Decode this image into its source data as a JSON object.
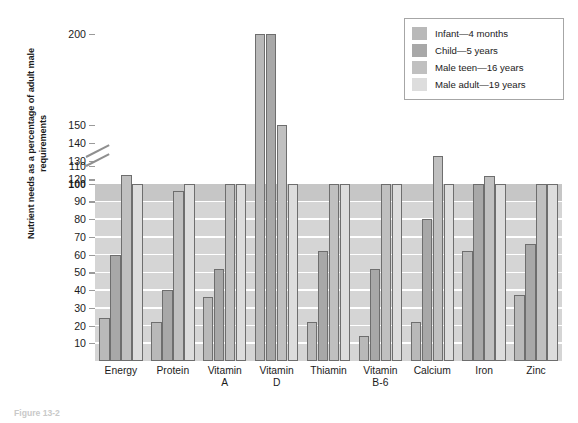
{
  "chart_data": {
    "type": "bar",
    "title": "",
    "xlabel": "",
    "ylabel": "Nutrient needs as a percentage of adult male requirements",
    "ylim": [
      0,
      210
    ],
    "grid": true,
    "legend_position": "top-right",
    "axis_break": {
      "after": 110,
      "before": 150,
      "symbol": "double-slash"
    },
    "reference_line": 100,
    "categories": [
      "Energy",
      "Protein",
      "Vitamin A",
      "Vitamin D",
      "Thiamin",
      "Vitamin B-6",
      "Calcium",
      "Iron",
      "Zinc"
    ],
    "category_lines": [
      [
        "Energy",
        ""
      ],
      [
        "Protein",
        ""
      ],
      [
        "Vitamin",
        "A"
      ],
      [
        "Vitamin",
        "D"
      ],
      [
        "Thiamin",
        ""
      ],
      [
        "Vitamin",
        "B-6"
      ],
      [
        "Calcium",
        ""
      ],
      [
        "Iron",
        ""
      ],
      [
        "Zinc",
        ""
      ]
    ],
    "series": [
      {
        "name": "Infant—4 months",
        "color": "#b9b9b9",
        "values": [
          24,
          22,
          36,
          200,
          22,
          14,
          22,
          62,
          37
        ]
      },
      {
        "name": "Child—5 years",
        "color": "#a8a8a8",
        "values": [
          60,
          40,
          52,
          200,
          62,
          52,
          80,
          100,
          66
        ]
      },
      {
        "name": "Male teen—16 years",
        "color": "#c0c0c0",
        "values": [
          105,
          96,
          100,
          150,
          100,
          100,
          133,
          122,
          100
        ]
      },
      {
        "name": "Male adult—19 years",
        "color": "#dddddd",
        "values": [
          100,
          100,
          100,
          100,
          100,
          100,
          100,
          100,
          100
        ]
      }
    ],
    "yticks": [
      {
        "value": 10,
        "label": "10",
        "bold": false
      },
      {
        "value": 20,
        "label": "20",
        "bold": false
      },
      {
        "value": 30,
        "label": "30",
        "bold": false
      },
      {
        "value": 40,
        "label": "40",
        "bold": false
      },
      {
        "value": 50,
        "label": "50",
        "bold": false
      },
      {
        "value": 60,
        "label": "60",
        "bold": false
      },
      {
        "value": 70,
        "label": "70",
        "bold": false
      },
      {
        "value": 80,
        "label": "80",
        "bold": false
      },
      {
        "value": 90,
        "label": "90",
        "bold": false
      },
      {
        "value": 100,
        "label": "100",
        "bold": true
      },
      {
        "value": 110,
        "label": "110",
        "bold": false
      },
      {
        "value": 120,
        "label": "120",
        "bold": false
      },
      {
        "value": 130,
        "label": "130",
        "bold": false
      },
      {
        "value": 140,
        "label": "140",
        "bold": false
      },
      {
        "value": 150,
        "label": "150",
        "bold": false
      },
      {
        "value": 200,
        "label": "200",
        "bold": false
      }
    ]
  },
  "legend": {
    "items": [
      {
        "label": "Infant—4 months",
        "swatch": "#b9b9b9"
      },
      {
        "label": "Child—5 years",
        "swatch": "#a8a8a8"
      },
      {
        "label": "Male teen—16 years",
        "swatch": "#c0c0c0"
      },
      {
        "label": "Male adult—19 years",
        "swatch": "#dddddd"
      }
    ]
  },
  "caption": {
    "text": "Figure 13-2"
  },
  "colors": {
    "plot_band": "#d5d5d5",
    "band_90_100": "#c6c6c6",
    "gridline": "#ffffff",
    "axis": "#9a9a9a",
    "bar_outline": "#6e6e6e",
    "text": "#1b1b1b"
  }
}
